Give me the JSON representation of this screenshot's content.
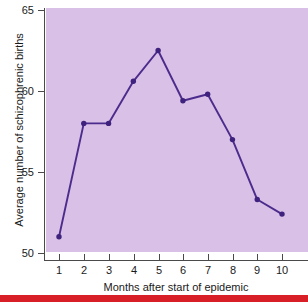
{
  "chart_data": {
    "type": "line",
    "title": "",
    "xlabel": "Months after start of epidemic",
    "ylabel": "Average number of schizophrenic births",
    "x": [
      1,
      2,
      3,
      4,
      5,
      6,
      7,
      8,
      9,
      10
    ],
    "categories": [
      "1",
      "2",
      "3",
      "4",
      "5",
      "6",
      "7",
      "8",
      "9",
      "10"
    ],
    "values": [
      51.0,
      58.0,
      58.0,
      60.6,
      62.5,
      59.4,
      59.8,
      57.0,
      53.3,
      52.4
    ],
    "series": [
      {
        "name": "Average number of schizophrenic births",
        "values": [
          51.0,
          58.0,
          58.0,
          60.6,
          62.5,
          59.4,
          59.8,
          57.0,
          53.3,
          52.4
        ]
      }
    ],
    "ylim": [
      50,
      65
    ],
    "xlim": [
      0.5,
      10.5
    ],
    "yticks": [
      50,
      55,
      60,
      65
    ],
    "ytick_labels": [
      "50",
      "55",
      "60",
      "65"
    ],
    "xticks": [
      1,
      2,
      3,
      4,
      5,
      6,
      7,
      8,
      9,
      10
    ],
    "xtick_labels": [
      "1",
      "2",
      "3",
      "4",
      "5",
      "6",
      "7",
      "8",
      "9",
      "10"
    ],
    "grid": false,
    "legend": false,
    "legend_position": "none",
    "line_color": "#4b2b8c",
    "marker_color": "#3f217e",
    "marker": "circle",
    "plot_background": "#d8c0e6",
    "axis_color": "#4a4a4a",
    "figure_background": "#ffffff",
    "accent_rule_color": "#d81f28"
  }
}
